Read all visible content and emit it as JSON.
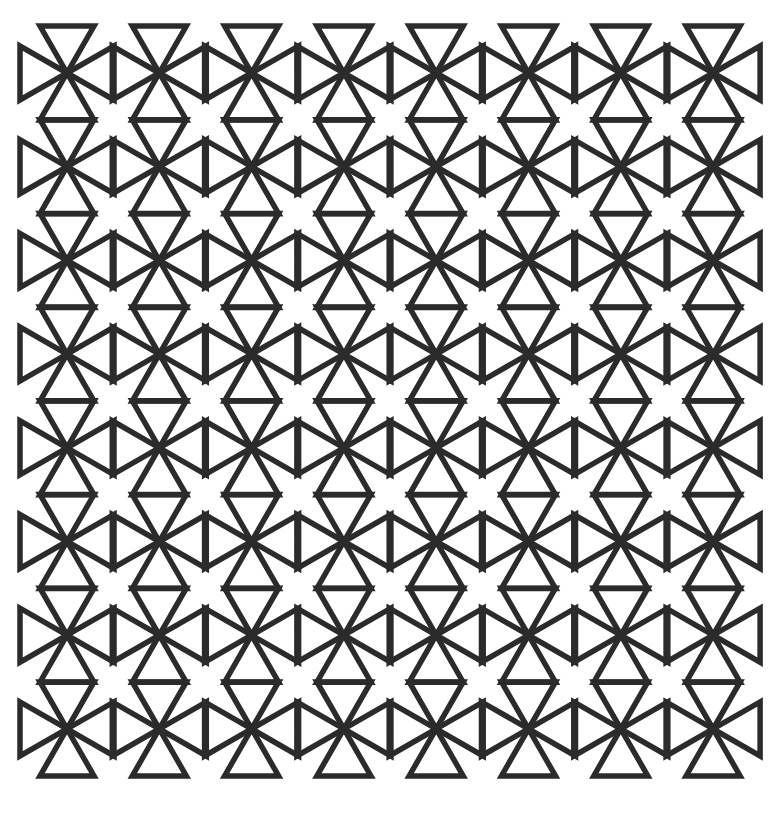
{
  "pattern": {
    "description": "Geometric tiling of outlined triangles radiating from grid vertices",
    "columns": 8,
    "rows": 8,
    "origin_x": 67,
    "origin_y": 73,
    "spacing_x": 92.3,
    "spacing_y": 93.7,
    "triangle_half_base": 27,
    "triangle_height": 47,
    "stroke_width": 5.5,
    "stroke_color": "#2b2b2b",
    "background_color": "#ffffff"
  }
}
